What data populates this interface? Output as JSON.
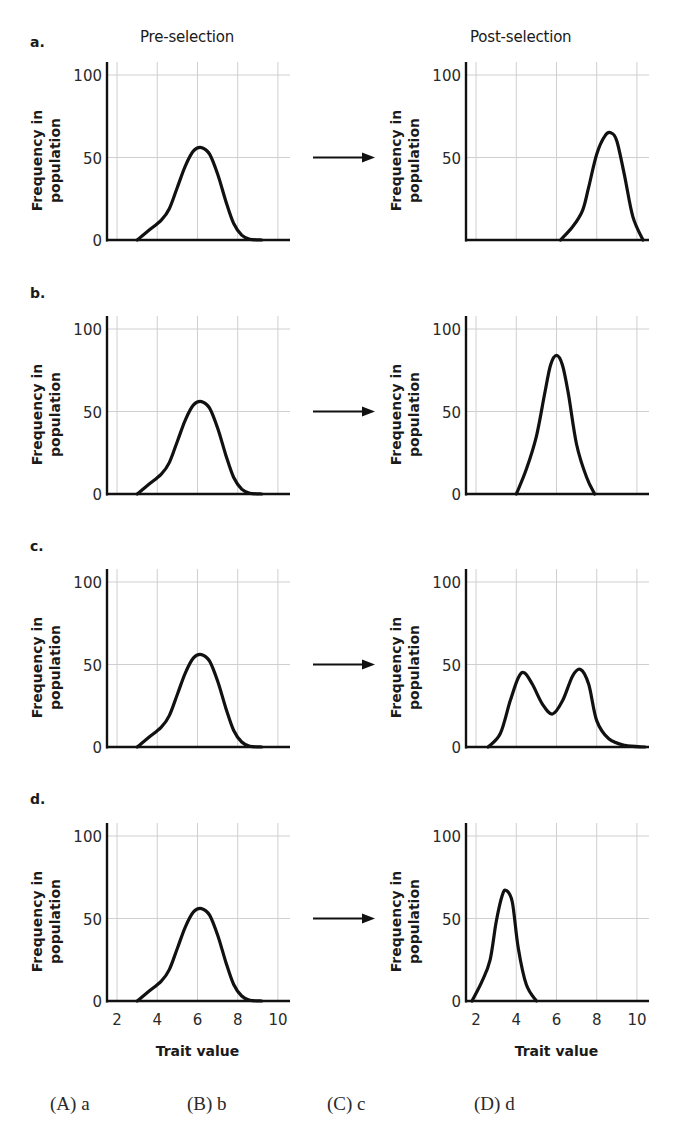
{
  "headers": {
    "pre": "Pre-selection",
    "post": "Post-selection"
  },
  "rows": [
    {
      "label": "a."
    },
    {
      "label": "b."
    },
    {
      "label": "c."
    },
    {
      "label": "d."
    }
  ],
  "axis": {
    "ylabel_line1": "Frequency in",
    "ylabel_line2": "population",
    "xlabel": "Trait value",
    "yticks": [
      "0",
      "50",
      "100"
    ],
    "xticks": [
      "2",
      "4",
      "6",
      "8",
      "10"
    ]
  },
  "choices": [
    {
      "label": "(A) a"
    },
    {
      "label": "(B) b"
    },
    {
      "label": "(C) c"
    },
    {
      "label": "(D) d"
    }
  ],
  "colors": {
    "curve": "#111111",
    "axis": "#111111",
    "grid": "#cfcfcf",
    "text": "#1a1a1a"
  },
  "chart_data": [
    {
      "type": "line",
      "panel": "a",
      "stage": "pre",
      "title": "Pre-selection",
      "xlabel": "Trait value",
      "ylabel": "Frequency in population",
      "xlim": [
        1.5,
        10.6
      ],
      "ylim": [
        0,
        100
      ],
      "grid": true,
      "show_y0": true,
      "show_xticks": false,
      "x": [
        3.0,
        3.6,
        4.2,
        4.6,
        5.0,
        5.4,
        5.8,
        6.2,
        6.6,
        7.0,
        7.4,
        7.8,
        8.2,
        8.6,
        9.2
      ],
      "y": [
        0,
        6,
        12,
        19,
        32,
        45,
        54,
        56,
        52,
        40,
        24,
        10,
        3,
        0.5,
        0
      ]
    },
    {
      "type": "line",
      "panel": "a",
      "stage": "post",
      "title": "Post-selection",
      "xlabel": "Trait value",
      "ylabel": "Frequency in population",
      "xlim": [
        1.5,
        10.6
      ],
      "ylim": [
        0,
        100
      ],
      "grid": true,
      "show_y0": false,
      "show_xticks": false,
      "x": [
        6.2,
        6.8,
        7.3,
        7.6,
        8.0,
        8.4,
        8.7,
        9.0,
        9.4,
        9.8,
        10.3
      ],
      "y": [
        0,
        8,
        18,
        32,
        52,
        63,
        65,
        60,
        38,
        14,
        0
      ]
    },
    {
      "type": "line",
      "panel": "b",
      "stage": "pre",
      "xlim": [
        1.5,
        10.6
      ],
      "ylim": [
        0,
        100
      ],
      "grid": true,
      "show_y0": true,
      "show_xticks": false,
      "x": [
        3.0,
        3.6,
        4.2,
        4.6,
        5.0,
        5.4,
        5.8,
        6.2,
        6.6,
        7.0,
        7.4,
        7.8,
        8.2,
        8.6,
        9.2
      ],
      "y": [
        0,
        6,
        12,
        19,
        32,
        45,
        54,
        56,
        52,
        40,
        24,
        10,
        3,
        0.5,
        0
      ]
    },
    {
      "type": "line",
      "panel": "b",
      "stage": "post",
      "xlim": [
        1.5,
        10.6
      ],
      "ylim": [
        0,
        100
      ],
      "grid": true,
      "show_y0": true,
      "show_xticks": false,
      "x": [
        4.0,
        4.5,
        5.0,
        5.4,
        5.7,
        6.0,
        6.3,
        6.6,
        7.0,
        7.5,
        7.9
      ],
      "y": [
        0,
        15,
        35,
        60,
        78,
        84,
        78,
        60,
        30,
        10,
        0
      ]
    },
    {
      "type": "line",
      "panel": "c",
      "stage": "pre",
      "xlim": [
        1.5,
        10.6
      ],
      "ylim": [
        0,
        100
      ],
      "grid": true,
      "show_y0": true,
      "show_xticks": false,
      "x": [
        3.0,
        3.6,
        4.2,
        4.6,
        5.0,
        5.4,
        5.8,
        6.2,
        6.6,
        7.0,
        7.4,
        7.8,
        8.2,
        8.6,
        9.2
      ],
      "y": [
        0,
        6,
        12,
        19,
        32,
        45,
        54,
        56,
        52,
        40,
        24,
        10,
        3,
        0.5,
        0
      ]
    },
    {
      "type": "line",
      "panel": "c",
      "stage": "post",
      "xlim": [
        1.5,
        10.6
      ],
      "ylim": [
        0,
        100
      ],
      "grid": true,
      "show_y0": true,
      "show_xticks": false,
      "x": [
        2.6,
        3.2,
        3.7,
        4.1,
        4.4,
        4.8,
        5.3,
        5.8,
        6.3,
        6.8,
        7.2,
        7.6,
        8.0,
        8.6,
        9.4,
        10.4
      ],
      "y": [
        0,
        8,
        28,
        42,
        45,
        38,
        26,
        20,
        28,
        43,
        47,
        38,
        16,
        5,
        1,
        0
      ]
    },
    {
      "type": "line",
      "panel": "d",
      "stage": "pre",
      "xlim": [
        1.5,
        10.6
      ],
      "ylim": [
        0,
        100
      ],
      "grid": true,
      "show_y0": true,
      "show_xticks": true,
      "x": [
        3.0,
        3.6,
        4.2,
        4.6,
        5.0,
        5.4,
        5.8,
        6.2,
        6.6,
        7.0,
        7.4,
        7.8,
        8.2,
        8.6,
        9.2
      ],
      "y": [
        0,
        6,
        12,
        19,
        32,
        45,
        54,
        56,
        52,
        40,
        24,
        10,
        3,
        0.5,
        0
      ]
    },
    {
      "type": "line",
      "panel": "d",
      "stage": "post",
      "xlim": [
        1.5,
        10.6
      ],
      "ylim": [
        0,
        100
      ],
      "grid": true,
      "show_y0": true,
      "show_xticks": true,
      "x": [
        1.8,
        2.3,
        2.7,
        3.0,
        3.3,
        3.5,
        3.8,
        4.1,
        4.5,
        5.0
      ],
      "y": [
        0,
        12,
        25,
        48,
        64,
        67,
        60,
        32,
        10,
        0
      ]
    }
  ]
}
